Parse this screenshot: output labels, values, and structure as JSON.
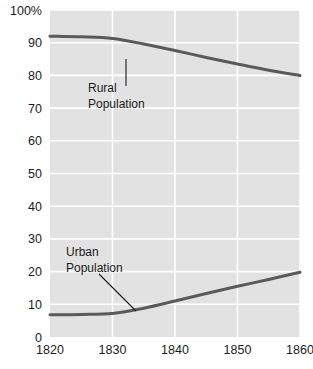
{
  "chart_data": {
    "type": "line",
    "title": "",
    "subtitle": "",
    "xlabel": "",
    "ylabel": "",
    "xlim": [
      1820,
      1860
    ],
    "ylim": [
      0,
      100
    ],
    "grid": true,
    "legend_position": "inline-annotations",
    "x": [
      1820,
      1825,
      1830,
      1835,
      1840,
      1845,
      1850,
      1855,
      1860
    ],
    "xticks": [
      1820,
      1830,
      1840,
      1850,
      1860
    ],
    "xtick_labels": [
      "1820",
      "1830",
      "1840",
      "1850",
      "1860"
    ],
    "yticks": [
      0,
      10,
      20,
      30,
      40,
      50,
      60,
      70,
      80,
      90,
      100
    ],
    "ytick_labels": [
      "0",
      "10",
      "20",
      "30",
      "40",
      "50",
      "60",
      "70",
      "80",
      "90",
      "100%"
    ],
    "series": [
      {
        "name": "Rural Population",
        "color": "#5a5a5a",
        "values": [
          92.0,
          91.8,
          91.3,
          89.6,
          87.6,
          85.5,
          83.5,
          81.6,
          80.0
        ]
      },
      {
        "name": "Urban Population",
        "color": "#5a5a5a",
        "values": [
          6.8,
          6.9,
          7.2,
          8.8,
          11.0,
          13.3,
          15.5,
          17.6,
          19.8
        ]
      }
    ],
    "annotations": [
      {
        "label_line_1": "Rural",
        "label_line_2": "Population",
        "text_x": 88,
        "text_y": 92,
        "leader_x1": 126,
        "leader_y1": 59,
        "leader_x2": 126,
        "leader_y2": 86
      },
      {
        "label_line_1": "Urban",
        "label_line_2": "Population",
        "text_x": 66,
        "text_y": 256,
        "leader_x1": 99,
        "leader_y1": 274,
        "leader_x2": 136,
        "leader_y2": 311
      }
    ],
    "colors": {
      "plot_background": "#e2e2e2",
      "gridline": "#ffffff",
      "line": "#5a5a5a",
      "text": "#1b1b1b",
      "page_background": "#ffffff"
    }
  }
}
